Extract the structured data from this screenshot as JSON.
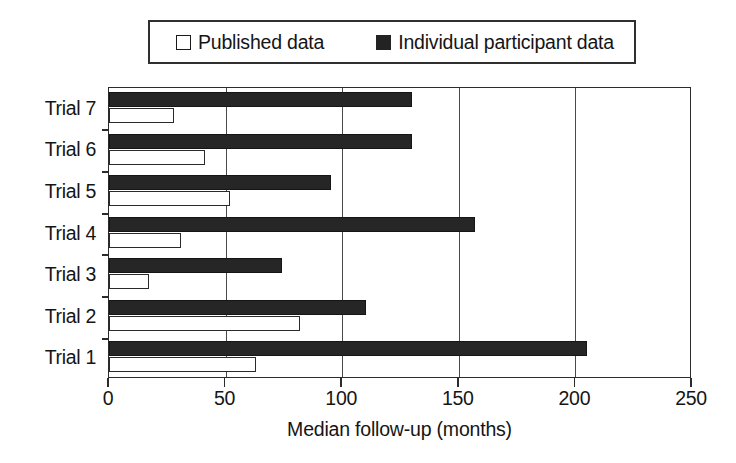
{
  "legend": {
    "entries": [
      {
        "label": "Published data",
        "swatch": "open-square-swatch",
        "color": "#ffffff"
      },
      {
        "label": "Individual participant data",
        "swatch": "filled-square-swatch",
        "color": "#262626"
      }
    ]
  },
  "axes": {
    "x_title": "Median follow-up (months)",
    "x_ticks": [
      "0",
      "50",
      "100",
      "150",
      "200",
      "250"
    ],
    "y_ticks": [
      "Trial 7",
      "Trial 6",
      "Trial 5",
      "Trial 4",
      "Trial 3",
      "Trial 2",
      "Trial 1"
    ]
  },
  "chart_data": {
    "type": "bar",
    "orientation": "horizontal",
    "title": "",
    "xlabel": "Median follow-up (months)",
    "ylabel": "",
    "xlim": [
      0,
      250
    ],
    "xticks": [
      0,
      50,
      100,
      150,
      200,
      250
    ],
    "grid": "vertical",
    "legend_position": "top",
    "categories": [
      "Trial 1",
      "Trial 2",
      "Trial 3",
      "Trial 4",
      "Trial 5",
      "Trial 6",
      "Trial 7"
    ],
    "category_order_top_to_bottom": [
      "Trial 7",
      "Trial 6",
      "Trial 5",
      "Trial 4",
      "Trial 3",
      "Trial 2",
      "Trial 1"
    ],
    "series": [
      {
        "name": "Published data",
        "color": "#ffffff",
        "edgecolor": "#2a2a2a",
        "values": [
          63,
          82,
          17,
          31,
          52,
          41,
          28
        ]
      },
      {
        "name": "Individual participant data",
        "color": "#262626",
        "edgecolor": "#151515",
        "values": [
          205,
          110,
          74,
          157,
          95,
          130,
          130
        ]
      }
    ]
  }
}
